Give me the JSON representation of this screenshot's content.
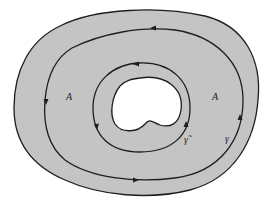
{
  "diagram": {
    "labels": {
      "region_left": "A",
      "region_right": "A",
      "inner_curve": "γ̃",
      "outer_curve": "γ"
    },
    "colors": {
      "region_fill": "#c4c4c4",
      "hole_fill": "#ffffff",
      "stroke": "#1e1e1e"
    }
  }
}
